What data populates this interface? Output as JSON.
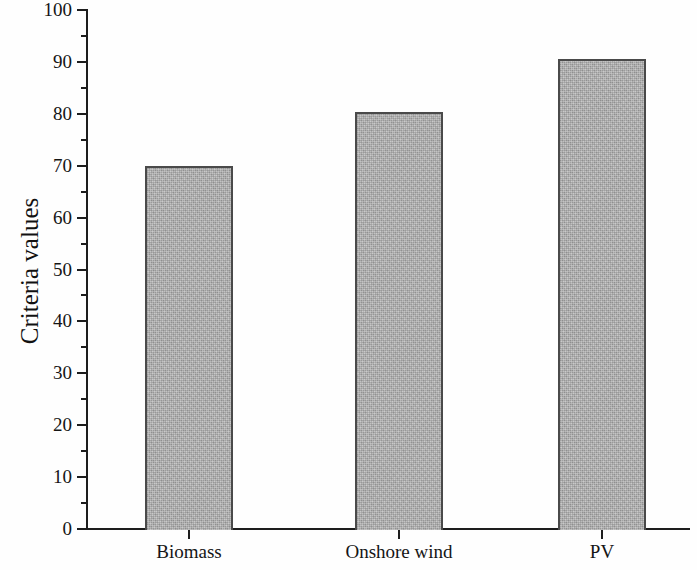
{
  "chart_data": {
    "type": "bar",
    "title": "",
    "xlabel": "",
    "ylabel": "Criteria values",
    "categories": [
      "Biomass",
      "Onshore wind",
      "PV"
    ],
    "values": [
      70.0,
      80.3,
      90.6
    ],
    "ylim": [
      0,
      100
    ],
    "y_major_step": 10,
    "y_minor_step": 5,
    "y_tick_labels": [
      "0",
      "10",
      "20",
      "30",
      "40",
      "50",
      "60",
      "70",
      "80",
      "90",
      "100"
    ],
    "grid": false,
    "legend": null,
    "bar_fill_color": "#b0b0b0",
    "bar_border_color": "#4a4a4a",
    "axis_color": "#1d1d1d"
  },
  "axis": {
    "y_title": "Criteria values",
    "ticks": [
      {
        "value": "100"
      },
      {
        "value": "90"
      },
      {
        "value": "80"
      },
      {
        "value": "70"
      },
      {
        "value": "60"
      },
      {
        "value": "50"
      },
      {
        "value": "40"
      },
      {
        "value": "30"
      },
      {
        "value": "20"
      },
      {
        "value": "10"
      },
      {
        "value": "0"
      }
    ]
  },
  "series": {
    "bars": [
      {
        "label": "Biomass",
        "value": 70.0
      },
      {
        "label": "Onshore wind",
        "value": 80.3
      },
      {
        "label": "PV",
        "value": 90.6
      }
    ]
  }
}
